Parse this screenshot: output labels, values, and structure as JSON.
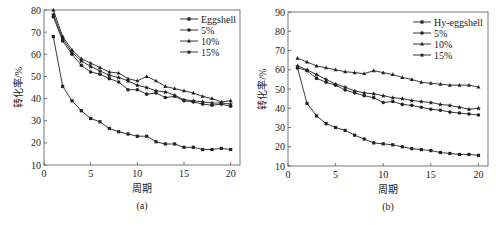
{
  "chart_data": [
    {
      "type": "line",
      "panel_label": "(a)",
      "title": "",
      "xlabel": "周期",
      "ylabel": "转化率/%",
      "xlim": [
        0,
        21
      ],
      "ylim": [
        10,
        80
      ],
      "xticks": [
        0,
        5,
        10,
        15,
        20
      ],
      "yticks": [
        10,
        20,
        30,
        40,
        50,
        60,
        70,
        80
      ],
      "grid": false,
      "legend_position": "upper right",
      "x": [
        1,
        2,
        3,
        4,
        5,
        6,
        7,
        8,
        9,
        10,
        11,
        12,
        13,
        14,
        15,
        16,
        17,
        18,
        19,
        20
      ],
      "series": [
        {
          "name": "Eggshell",
          "marker": "square",
          "values": [
            68,
            45.5,
            39,
            34.5,
            31,
            29.5,
            26.5,
            25,
            24,
            23,
            23,
            20.5,
            19.5,
            19.5,
            18,
            18,
            17,
            17,
            17.5,
            17
          ]
        },
        {
          "name": "5%",
          "marker": "circle",
          "values": [
            77,
            66,
            60,
            55,
            52,
            51,
            49,
            47.5,
            44,
            44,
            42,
            42.5,
            40.5,
            41,
            39,
            38.5,
            37.5,
            37,
            37.5,
            36.5
          ]
        },
        {
          "name": "10%",
          "marker": "triangle",
          "values": [
            80,
            68,
            62,
            58,
            56,
            54,
            52,
            51.5,
            49,
            48,
            50,
            48,
            45.5,
            44.5,
            43.5,
            42.5,
            41,
            40,
            38.5,
            39
          ]
        },
        {
          "name": "15%",
          "marker": "star",
          "values": [
            78,
            67,
            61,
            57,
            54.5,
            52.5,
            50.5,
            49.5,
            48,
            46,
            45,
            43.5,
            43,
            41.5,
            39.5,
            39,
            38.5,
            38,
            38,
            37.5
          ]
        }
      ]
    },
    {
      "type": "line",
      "panel_label": "(b)",
      "title": "",
      "xlabel": "周期",
      "ylabel": "转化率/%",
      "xlim": [
        0,
        21
      ],
      "ylim": [
        10,
        90
      ],
      "xticks": [
        0,
        5,
        10,
        15,
        20
      ],
      "yticks": [
        10,
        20,
        30,
        40,
        50,
        60,
        70,
        80,
        90
      ],
      "grid": false,
      "legend_position": "upper right",
      "x": [
        1,
        2,
        3,
        4,
        5,
        6,
        7,
        8,
        9,
        10,
        11,
        12,
        13,
        14,
        15,
        16,
        17,
        18,
        19,
        20
      ],
      "series": [
        {
          "name": "Hy-eggshell",
          "marker": "square",
          "values": [
            61,
            42.5,
            36,
            32,
            30,
            28.5,
            26,
            24,
            22,
            21.5,
            21,
            20,
            19,
            18.5,
            18,
            17,
            16.5,
            16,
            16,
            15.5
          ]
        },
        {
          "name": "5%",
          "marker": "circle",
          "values": [
            61,
            59.5,
            55.5,
            53.5,
            52,
            49.5,
            48,
            46.5,
            45.5,
            43,
            43.5,
            42,
            41.5,
            40.5,
            39.5,
            39,
            38,
            37.5,
            37,
            36.5
          ]
        },
        {
          "name": "10%",
          "marker": "triangle",
          "values": [
            66,
            64,
            62,
            61,
            60,
            59,
            58.5,
            58,
            59.5,
            58.5,
            57.5,
            56,
            55,
            53.5,
            53,
            52.5,
            52,
            52,
            52,
            51
          ]
        },
        {
          "name": "15%",
          "marker": "star",
          "values": [
            62,
            60,
            57.5,
            55,
            52.5,
            51,
            49,
            48,
            47.5,
            46.5,
            45.5,
            45,
            44,
            43.5,
            43,
            42,
            41.5,
            40.5,
            39.5,
            40
          ]
        }
      ]
    }
  ]
}
